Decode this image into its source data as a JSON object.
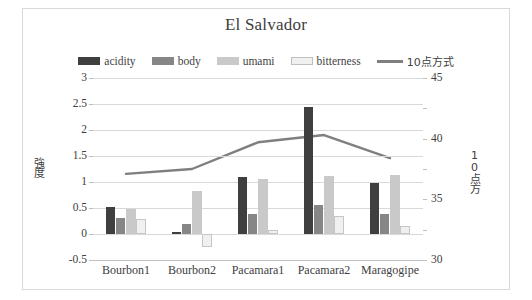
{
  "chart_data": {
    "type": "bar",
    "title": "El Salvador",
    "categories": [
      "Bourbon1",
      "Bourbon2",
      "Pacamara1",
      "Pacamara2",
      "Maragogipe"
    ],
    "series": [
      {
        "name": "acidity",
        "type": "bar",
        "axis": "left",
        "color": "#3f3f3f",
        "values": [
          0.51,
          0.04,
          1.1,
          2.44,
          0.99
        ]
      },
      {
        "name": "body",
        "type": "bar",
        "axis": "left",
        "color": "#868686",
        "values": [
          0.3,
          0.19,
          0.39,
          0.55,
          0.38
        ]
      },
      {
        "name": "umami",
        "type": "bar",
        "axis": "left",
        "color": "#c9c9c9",
        "values": [
          0.49,
          0.82,
          1.06,
          1.11,
          1.13
        ]
      },
      {
        "name": "bitterness",
        "type": "bar",
        "axis": "left",
        "color": "#f0f0f0",
        "values": [
          0.28,
          -0.25,
          0.07,
          0.34,
          0.15
        ]
      },
      {
        "name": "10点方式",
        "type": "line",
        "axis": "right",
        "color": "#7f7f7f",
        "values": [
          37.1,
          37.5,
          39.7,
          40.3,
          38.4
        ]
      }
    ],
    "xlabel": "",
    "ylabel": "強度",
    "y2label": "10点方",
    "ylim": [
      -0.5,
      3
    ],
    "yticks": [
      "3",
      "2.5",
      "2",
      "1.5",
      "1",
      "0.5",
      "0",
      "-0.5"
    ],
    "ytickvals": [
      3,
      2.5,
      2,
      1.5,
      1,
      0.5,
      0,
      -0.5
    ],
    "y2lim": [
      30,
      45
    ],
    "y2ticks": [
      "45",
      "40",
      "35",
      "30"
    ],
    "y2tickvals": [
      45,
      40,
      35,
      30
    ],
    "grid": true,
    "legend_position": "top"
  },
  "legend": {
    "items": [
      {
        "label": "acidity",
        "marker": "swatch-dark",
        "color": "#3f3f3f"
      },
      {
        "label": "body",
        "marker": "swatch-medium",
        "color": "#868686"
      },
      {
        "label": "umami",
        "marker": "swatch-light",
        "color": "#c9c9c9"
      },
      {
        "label": "bitterness",
        "marker": "swatch-pale",
        "color": "#f0f0f0"
      },
      {
        "label": "10点方式",
        "marker": "line",
        "color": "#7f7f7f"
      }
    ]
  }
}
